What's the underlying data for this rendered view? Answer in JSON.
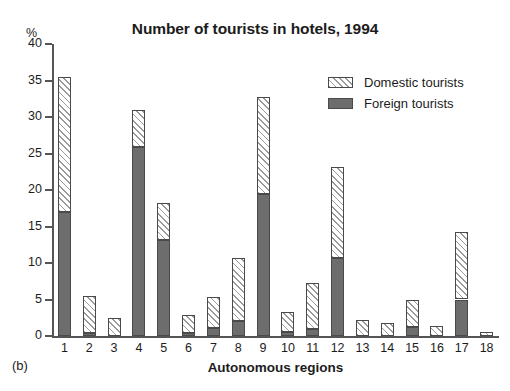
{
  "panel": {
    "label": "(b)"
  },
  "legend": {
    "position": "top-right",
    "entries": [
      {
        "label": "Domestic tourists",
        "swatch": "hatched-diagonal",
        "color": "#ffffff"
      },
      {
        "label": "Foreign tourists",
        "swatch": "solid-gray",
        "color": "#6d6d6d"
      }
    ]
  },
  "chart_data": {
    "type": "bar",
    "stacked": true,
    "title": "Number of tourists in hotels, 1994",
    "xlabel": "Autonomous regions",
    "ylabel": "%",
    "ylim": [
      0,
      40
    ],
    "yticks": [
      0,
      5,
      10,
      15,
      20,
      25,
      30,
      35,
      40
    ],
    "ytick_labels": [
      "0",
      "5",
      "10",
      "15",
      "20",
      "25",
      "30",
      "35",
      "40"
    ],
    "grid": false,
    "categories": [
      "1",
      "2",
      "3",
      "4",
      "5",
      "6",
      "7",
      "8",
      "9",
      "10",
      "11",
      "12",
      "13",
      "14",
      "15",
      "16",
      "17",
      "18"
    ],
    "series": [
      {
        "name": "Foreign tourists",
        "color": "#6d6d6d",
        "values": [
          17.0,
          0.4,
          0.0,
          25.9,
          13.1,
          0.4,
          1.1,
          2.0,
          19.5,
          0.5,
          1.0,
          10.7,
          0.0,
          0.0,
          1.2,
          0.0,
          5.0,
          0.0
        ]
      },
      {
        "name": "Domestic tourists",
        "color": "#ffffff",
        "values": [
          18.5,
          5.1,
          2.4,
          5.1,
          5.1,
          2.5,
          4.3,
          8.7,
          13.3,
          2.8,
          6.2,
          12.4,
          2.2,
          1.8,
          3.8,
          1.4,
          9.3,
          0.5
        ]
      }
    ],
    "totals": [
      35.5,
      5.5,
      2.4,
      31.0,
      18.2,
      2.9,
      5.4,
      10.7,
      32.8,
      3.3,
      7.2,
      23.1,
      2.2,
      1.8,
      5.0,
      1.4,
      14.3,
      0.5
    ]
  }
}
